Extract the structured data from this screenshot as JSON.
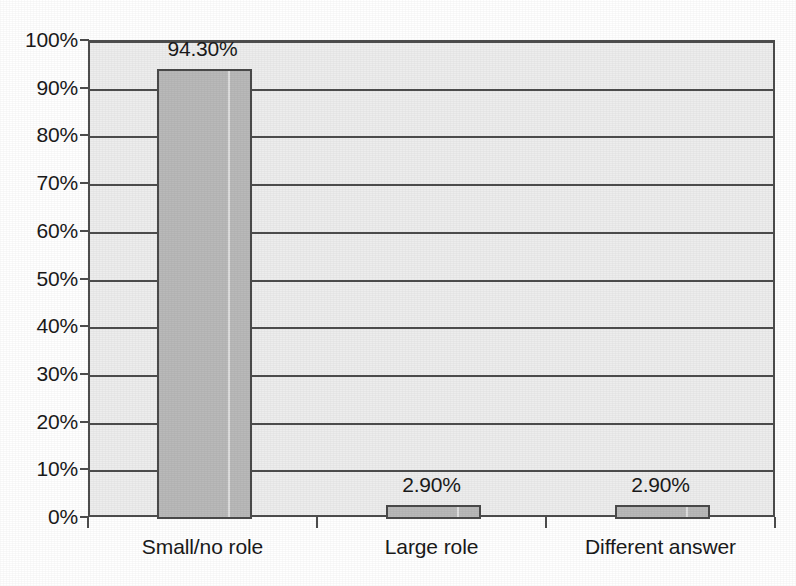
{
  "chart_data": {
    "type": "bar",
    "title": "",
    "subtitle": "",
    "xlabel": "",
    "ylabel": "",
    "categories": [
      "Small/no role",
      "Large role",
      "Different answer"
    ],
    "values": [
      94.3,
      2.9,
      2.9
    ],
    "data_labels": [
      "94.30%",
      "2.90%",
      "2.90%"
    ],
    "ylim": [
      0,
      100
    ],
    "ytick_values": [
      0,
      10,
      20,
      30,
      40,
      50,
      60,
      70,
      80,
      90,
      100
    ],
    "ytick_labels": [
      "0%",
      "10%",
      "20%",
      "30%",
      "40%",
      "50%",
      "60%",
      "70%",
      "80%",
      "90%",
      "100%"
    ],
    "grid": true,
    "grid_axis": "y",
    "legend": false,
    "legend_position": "none",
    "series": [
      {
        "name": "",
        "values": [
          94.3,
          2.9,
          2.9
        ]
      }
    ],
    "colors": {
      "bar_fill": "#b9b9b9",
      "bar_border": "#4a4a4a",
      "plot_background": "#ededed",
      "page_background": "#ffffff",
      "grid": "#4d4d4d",
      "axis": "#4d4d4d",
      "text": "#1a1a1a"
    }
  }
}
